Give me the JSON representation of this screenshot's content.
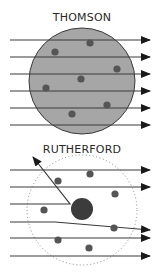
{
  "thomson": {
    "title": "THOMSON",
    "sphere": {
      "cx": 82,
      "cy": 81,
      "r": 53,
      "fill": "#a6a6a6",
      "stroke": "#3a3a3a"
    },
    "rays_y": [
      40,
      57,
      74,
      91,
      108,
      125
    ],
    "ray_x_start": 10,
    "ray_x_end": 150,
    "electrons": [
      [
        90,
        43
      ],
      [
        55,
        52
      ],
      [
        117,
        69
      ],
      [
        81,
        79
      ],
      [
        46,
        88
      ],
      [
        107,
        105
      ],
      [
        72,
        114
      ]
    ],
    "electron_color": "#555555"
  },
  "rutherford": {
    "title": "RUTHERFORD",
    "atom_boundary": {
      "cx": 82,
      "cy": 210,
      "r": 55,
      "style": "dotted",
      "color": "#888888"
    },
    "nucleus": {
      "cx": 82,
      "cy": 209,
      "r": 11,
      "color": "#3c3c3c"
    },
    "rays": [
      {
        "type": "straight",
        "y": 170
      },
      {
        "type": "straight",
        "y": 187
      },
      {
        "type": "backscatter",
        "y": 204,
        "turn_x": 70,
        "end": [
          33,
          157
        ]
      },
      {
        "type": "deflected",
        "y": 222,
        "bend_x": 55,
        "end": [
          150,
          230
        ]
      },
      {
        "type": "straight",
        "y": 238
      },
      {
        "type": "straight",
        "y": 256
      }
    ],
    "ray_x_start": 10,
    "ray_x_end": 150,
    "electrons": [
      [
        58,
        181
      ],
      [
        90,
        174
      ],
      [
        115,
        194
      ],
      [
        44,
        210
      ],
      [
        114,
        228
      ],
      [
        58,
        240
      ],
      [
        89,
        248
      ]
    ],
    "electron_color": "#555555"
  },
  "ray_color": "#3a3a3a"
}
